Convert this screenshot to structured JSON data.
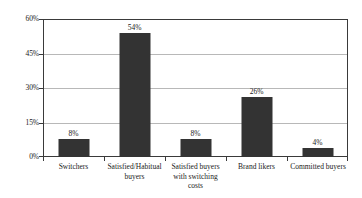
{
  "chart_data": {
    "type": "bar",
    "title": "",
    "subtitle": "",
    "xlabel": "",
    "ylabel": "",
    "ylim": [
      0,
      60
    ],
    "yticks": [
      "0%",
      "15%",
      "30%",
      "45%",
      "60%"
    ],
    "ytick_values": [
      0,
      15,
      30,
      45,
      60
    ],
    "grid": true,
    "legend": false,
    "legend_position": "none",
    "categories": [
      "Switchers",
      "Satisfied/Habitual buyers",
      "Satisfied buyers with switching costs",
      "Brand likers",
      "Committed buyers"
    ],
    "category_lines": [
      [
        "Switchers"
      ],
      [
        "Satisfied/Habitual",
        "buyers"
      ],
      [
        "Satisfied buyers",
        "with switching",
        "costs"
      ],
      [
        "Brand likers"
      ],
      [
        "Committed buyers"
      ]
    ],
    "values": [
      8,
      54,
      8,
      26,
      4
    ],
    "data_labels": [
      "8%",
      "54%",
      "8%",
      "26%",
      "4%"
    ],
    "colors": {
      "bar": "#333333",
      "gridline": "#b8b8b8",
      "axis": "#3a3a3a",
      "background": "#ffffff",
      "text": "#1a1a1a"
    }
  }
}
